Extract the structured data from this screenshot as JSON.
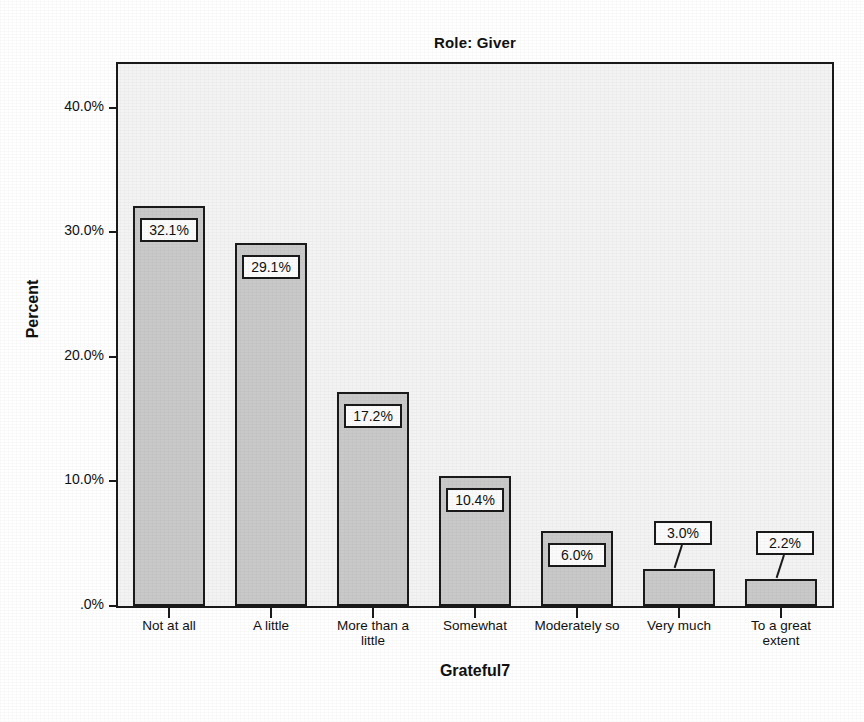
{
  "chart_data": {
    "type": "bar",
    "title": "Role: Giver",
    "xlabel": "Grateful7",
    "ylabel": "Percent",
    "categories": [
      "Not at all",
      "A little",
      "More than a little",
      "Somewhat",
      "Moderately so",
      "Very much",
      "To a great extent"
    ],
    "category_lines": [
      [
        "Not at all"
      ],
      [
        "A little"
      ],
      [
        "More than a",
        "little"
      ],
      [
        "Somewhat"
      ],
      [
        "Moderately so"
      ],
      [
        "Very much"
      ],
      [
        "To a great",
        "extent"
      ]
    ],
    "values": [
      32.1,
      29.1,
      17.2,
      10.4,
      6.0,
      3.0,
      2.2
    ],
    "value_labels": [
      "32.1%",
      "29.1%",
      "17.2%",
      "10.4%",
      "6.0%",
      "3.0%",
      "2.2%"
    ],
    "label_placement": [
      "inside",
      "inside",
      "inside",
      "inside",
      "inside",
      "outside",
      "outside"
    ],
    "ylim": [
      0,
      43.5
    ],
    "yticks": [
      0,
      10,
      20,
      30,
      40
    ],
    "ytick_labels": [
      ".0%",
      "10.0%",
      "20.0%",
      "30.0%",
      "40.0%"
    ],
    "grid": false,
    "legend": "none",
    "colors": {
      "bar_fill": "#c9c9c9",
      "bar_border": "#1a1a1a",
      "plot_background": "#f3f3f3",
      "page_background": "#ffffff",
      "text": "#111111",
      "label_box_fill": "#fbfbfb"
    }
  }
}
